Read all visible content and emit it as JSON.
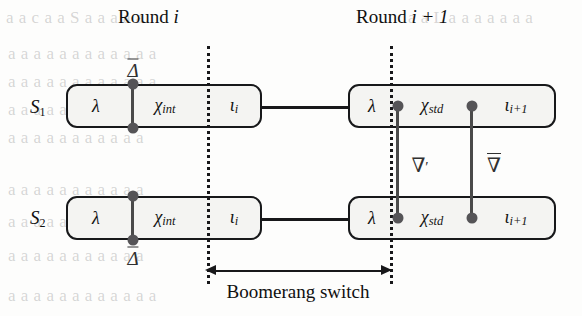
{
  "figure": {
    "type": "boomerang-switch-diagram",
    "caption": "Boomerang switch",
    "background_color": "#fdfdfc",
    "line_color": "#18181a",
    "node_color": "#555457",
    "box_fill": "#f4f4f2"
  },
  "headers": [
    {
      "id": "round-i",
      "prefix": "Round ",
      "index": "i",
      "full": "Round i"
    },
    {
      "id": "round-i-plus-1",
      "prefix": "Round ",
      "index": "i + 1",
      "full": "Round i + 1"
    }
  ],
  "state_labels": [
    {
      "id": "s1",
      "name": "S",
      "sub": "1",
      "full": "S1"
    },
    {
      "id": "s2",
      "name": "S",
      "sub": "2",
      "full": "S2"
    }
  ],
  "boxes": [
    {
      "id": "s1-round-i",
      "row": "S1",
      "round": "Round i",
      "cells": [
        {
          "id": "lambda",
          "symbol": "λ",
          "sub": ""
        },
        {
          "id": "chi-int",
          "symbol": "χ",
          "sub": "int"
        },
        {
          "id": "iota-i",
          "symbol": "ι",
          "sub": "i"
        }
      ]
    },
    {
      "id": "s1-round-i1",
      "row": "S1",
      "round": "Round i + 1",
      "cells": [
        {
          "id": "lambda",
          "symbol": "λ",
          "sub": ""
        },
        {
          "id": "chi-std",
          "symbol": "χ",
          "sub": "std"
        },
        {
          "id": "iota-i1",
          "symbol": "ι",
          "sub": "i+1"
        }
      ]
    },
    {
      "id": "s2-round-i",
      "row": "S2",
      "round": "Round i",
      "cells": [
        {
          "id": "lambda",
          "symbol": "λ",
          "sub": ""
        },
        {
          "id": "chi-int",
          "symbol": "χ",
          "sub": "int"
        },
        {
          "id": "iota-i",
          "symbol": "ι",
          "sub": "i"
        }
      ]
    },
    {
      "id": "s2-round-i1",
      "row": "S2",
      "round": "Round i + 1",
      "cells": [
        {
          "id": "lambda",
          "symbol": "λ",
          "sub": ""
        },
        {
          "id": "chi-std",
          "symbol": "χ",
          "sub": "std"
        },
        {
          "id": "iota-i1",
          "symbol": "ι",
          "sub": "i+1"
        }
      ]
    }
  ],
  "difference_symbols": [
    {
      "id": "delta-top",
      "glyph": "Δ",
      "overline": true,
      "prime": false,
      "label": "Delta-bar",
      "text": "Δ"
    },
    {
      "id": "delta-bottom",
      "glyph": "Δ",
      "overline": true,
      "prime": false,
      "label": "Delta-bar",
      "text": "Δ"
    },
    {
      "id": "nabla-prime",
      "glyph": "∇",
      "overline": false,
      "prime": true,
      "label": "nabla-prime",
      "text": "∇"
    },
    {
      "id": "nabla-bar",
      "glyph": "∇",
      "overline": true,
      "prime": false,
      "label": "nabla-bar",
      "text": "∇"
    }
  ],
  "bleed_text": [
    {
      "t": "a a c a a  S  a a a a a",
      "x": 6,
      "y": 8
    },
    {
      "t": "a a  L  a a a a a a a",
      "x": 408,
      "y": 8
    },
    {
      "t": "a a  a a  a a a a  a a a a",
      "x": 8,
      "y": 44
    },
    {
      "t": "a a a a  a a a  a a a a a",
      "x": 8,
      "y": 72
    },
    {
      "t": "a a a a a a a a a a",
      "x": 8,
      "y": 100
    },
    {
      "t": "a a a a a a  a a a a a",
      "x": 8,
      "y": 128
    },
    {
      "t": "a a a a a a a a a a a",
      "x": 8,
      "y": 180
    },
    {
      "t": "a a a a a a  a a a a",
      "x": 8,
      "y": 212
    },
    {
      "t": "a a a a a a a a  a a a",
      "x": 8,
      "y": 246
    },
    {
      "t": "a a a a a a a a a a a a",
      "x": 8,
      "y": 286
    }
  ]
}
